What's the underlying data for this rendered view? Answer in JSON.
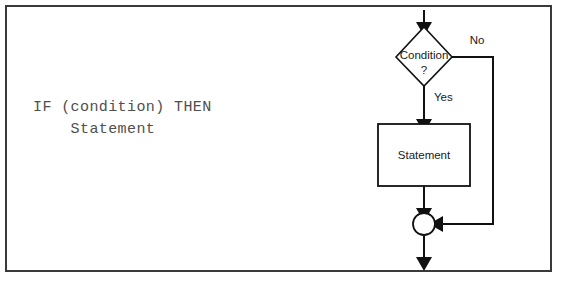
{
  "diagram": {
    "frame": {
      "stroke_color": "#3a3a3a"
    },
    "code": {
      "line1": "IF (condition) THEN",
      "line2": "    Statement",
      "text_color": "#4f4f4f"
    },
    "nodes": {
      "condition": {
        "label_line1": "Condition",
        "label_line2": "?",
        "shape": "diamond"
      },
      "statement": {
        "label": "Statement",
        "shape": "rectangle"
      },
      "merge": {
        "label": "",
        "shape": "circle"
      }
    },
    "edges": {
      "entry": {
        "label": ""
      },
      "yes_branch": {
        "label": "Yes"
      },
      "no_branch": {
        "label": "No"
      },
      "exit": {
        "label": ""
      }
    },
    "stroke_color": "#111111"
  }
}
